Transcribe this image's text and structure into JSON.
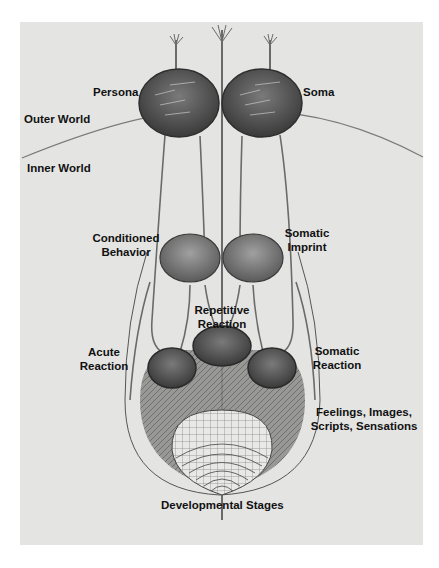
{
  "figure": {
    "type": "neurological-metaphor diagram",
    "colors": {
      "background": "#ffffff",
      "panel": "#e4e4e2",
      "node_dark": "#4a4a4a",
      "node_mid": "#7a7a7a",
      "line": "#6e6e6e",
      "text": "#111111"
    }
  },
  "labels": {
    "persona": "Persona",
    "soma": "Soma",
    "outer_world": "Outer World",
    "inner_world": "Inner World",
    "conditioned_behavior_1": "Conditioned",
    "conditioned_behavior_2": "Behavior",
    "somatic_imprint_1": "Somatic",
    "somatic_imprint_2": "Imprint",
    "repetitive_reaction_1": "Repetitive",
    "repetitive_reaction_2": "Reaction",
    "acute_reaction_1": "Acute",
    "acute_reaction_2": "Reaction",
    "somatic_reaction_1": "Somatic",
    "somatic_reaction_2": "Reaction",
    "feelings_1": "Feelings, Images,",
    "feelings_2": "Scripts, Sensations",
    "developmental_stages": "Developmental Stages"
  },
  "nodes": [
    {
      "id": "persona",
      "level": 1
    },
    {
      "id": "soma",
      "level": 1
    },
    {
      "id": "conditioned-behavior",
      "level": 2
    },
    {
      "id": "somatic-imprint",
      "level": 2
    },
    {
      "id": "repetitive-reaction",
      "level": 3
    },
    {
      "id": "acute-reaction",
      "level": 3
    },
    {
      "id": "somatic-reaction",
      "level": 3
    },
    {
      "id": "feelings-images-scripts-sensations",
      "level": 4
    },
    {
      "id": "developmental-stages",
      "level": 5
    }
  ]
}
